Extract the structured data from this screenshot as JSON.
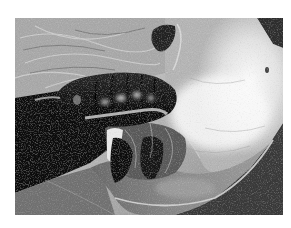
{
  "image": {
    "kind": "grayscale photograph",
    "subject": "dark glossy segmented pupa resting in a silk-webbed, folded leaf",
    "alt_text": "Black-and-white photo of a dark segmented pupa inside a silk web on a folded leaf",
    "frame": {
      "background_color": "#ffffff",
      "photo_left": 15,
      "photo_top": 18,
      "photo_width": 268,
      "photo_height": 197
    },
    "tones": {
      "pale_leaf": "#e6e6e6",
      "silk_highlight": "#f7f7f7",
      "mid_leaf": "#8c8c8c",
      "dark_shadow": "#0d0d0d",
      "pupa_body": "#1c1c1c",
      "pupa_highlight": "#cfcfcf",
      "background_corner": "#2e2e2e",
      "lower_leaf": "#6e6e6e"
    }
  }
}
